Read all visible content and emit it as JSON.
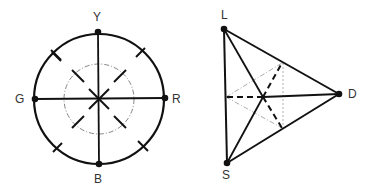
{
  "figure": {
    "left_diagram": {
      "name": "color opponent circle",
      "labels": {
        "top": "Y",
        "left": "G",
        "right": "R",
        "bottom": "B"
      }
    },
    "right_diagram": {
      "name": "LSD triangle",
      "labels": {
        "top": "L",
        "bottom": "S",
        "right": "D"
      }
    },
    "colors": {
      "stroke": "#111111",
      "faint": "#888888",
      "label": "#333333"
    }
  }
}
